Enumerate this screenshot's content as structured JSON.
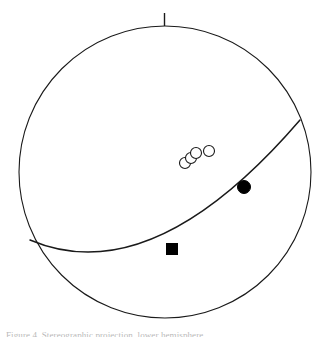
{
  "figure": {
    "title": "",
    "caption": "Figure 4. Stereographic projection, lower hemisphere",
    "background_color": "#ffffff",
    "line_color": "#1a1a1a",
    "marker_fill_color": "#000000",
    "marker_open_color": "#ffffff",
    "north_tick_label": "N"
  },
  "chart_data": {
    "type": "scatter",
    "xlabel": "",
    "ylabel": "",
    "xlim": [
      -1,
      1
    ],
    "ylim": [
      -1,
      1
    ],
    "grid": false,
    "legend_position": "none",
    "projection": {
      "primitive_circle": {
        "center_x": 165,
        "center_y": 172,
        "radius": 146,
        "stroke_width": 1.1
      },
      "north_tick": {
        "x": 164,
        "y_top": 13,
        "y_bottom": 26,
        "stroke_width": 1.4
      }
    },
    "annotations": [
      {
        "name": "great-circle-arc",
        "type": "great_circle",
        "start_x": 30,
        "start_y": 240,
        "end_x": 300,
        "end_y": 120,
        "control_x": 152,
        "control_y": 292,
        "stroke_width": 1.5
      }
    ],
    "series": [
      {
        "name": "Open circles (poles)",
        "marker": "open-circle",
        "marker_size": 11,
        "values": [
          {
            "x": 185,
            "y": 163,
            "label": ""
          },
          {
            "x": 191,
            "y": 158,
            "label": ""
          },
          {
            "x": 196,
            "y": 153,
            "label": ""
          },
          {
            "x": 209,
            "y": 151,
            "label": ""
          }
        ]
      },
      {
        "name": "Filled circle (lineation)",
        "marker": "filled-circle",
        "marker_size": 13,
        "values": [
          {
            "x": 244,
            "y": 187,
            "label": ""
          }
        ]
      },
      {
        "name": "Filled square (pole to plane)",
        "marker": "filled-square",
        "marker_size": 11,
        "values": [
          {
            "x": 172,
            "y": 249,
            "label": ""
          }
        ]
      }
    ]
  }
}
